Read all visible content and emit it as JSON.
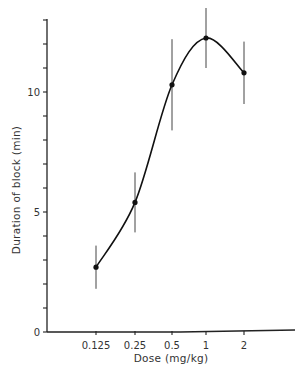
{
  "chart_data": {
    "type": "line",
    "title": "",
    "xlabel": "Dose (mg/kg)",
    "ylabel": "Duration of block (min)",
    "x_scale": "log2",
    "categories": [
      "0.125",
      "0.25",
      "0.5",
      "1",
      "2"
    ],
    "x": [
      0.125,
      0.25,
      0.5,
      1,
      2
    ],
    "series": [
      {
        "name": "Duration of block",
        "values": [
          2.7,
          5.4,
          10.3,
          12.25,
          10.8
        ],
        "error": [
          0.9,
          1.25,
          1.9,
          1.25,
          1.3
        ],
        "smooth_curve": true
      }
    ],
    "yticks": [
      0,
      5,
      10
    ],
    "yminor_step": 1,
    "ylim": [
      0,
      13
    ],
    "grid": false,
    "legend": "none"
  }
}
